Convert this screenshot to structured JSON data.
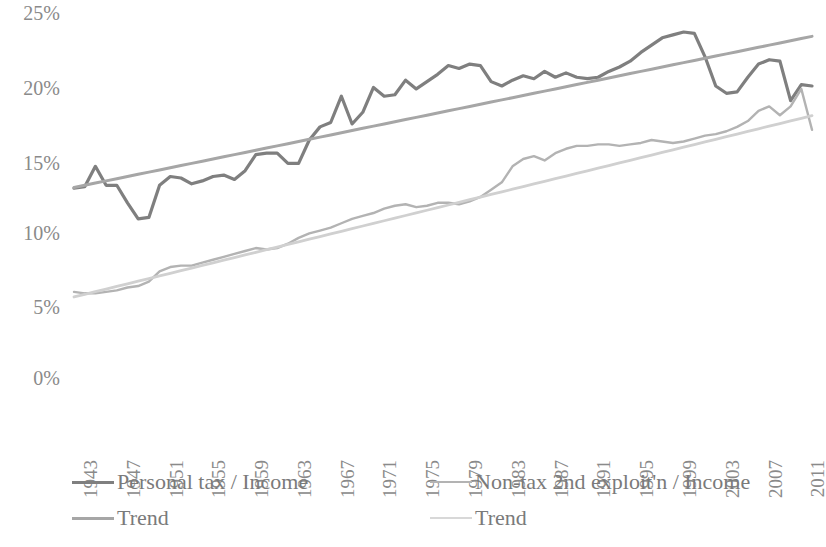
{
  "chart_data": {
    "type": "line",
    "title": "",
    "xlabel": "",
    "ylabel": "",
    "ylim": [
      0,
      25
    ],
    "y_ticks": [
      0,
      5,
      10,
      15,
      20,
      25
    ],
    "y_tick_labels": [
      "0%",
      "5%",
      "10%",
      "15%",
      "20%",
      "25%"
    ],
    "grid": false,
    "legend_position": "bottom",
    "x_start": 1943,
    "x_end": 2012,
    "x_tick_labels": [
      "1943",
      "1947",
      "1951",
      "1955",
      "1959",
      "1963",
      "1967",
      "1971",
      "1975",
      "1979",
      "1983",
      "1987",
      "1991",
      "1995",
      "1999",
      "2003",
      "2007",
      "2011"
    ],
    "x": [
      1943,
      1944,
      1945,
      1946,
      1947,
      1948,
      1949,
      1950,
      1951,
      1952,
      1953,
      1954,
      1955,
      1956,
      1957,
      1958,
      1959,
      1960,
      1961,
      1962,
      1963,
      1964,
      1965,
      1966,
      1967,
      1968,
      1969,
      1970,
      1971,
      1972,
      1973,
      1974,
      1975,
      1976,
      1977,
      1978,
      1979,
      1980,
      1981,
      1982,
      1983,
      1984,
      1985,
      1986,
      1987,
      1988,
      1989,
      1990,
      1991,
      1992,
      1993,
      1994,
      1995,
      1996,
      1997,
      1998,
      1999,
      2000,
      2001,
      2002,
      2003,
      2004,
      2005,
      2006,
      2007,
      2008,
      2009,
      2010,
      2011,
      2012
    ],
    "series": [
      {
        "name": "Personal tax / Income",
        "color": "#7f7f7f",
        "width": 3.2,
        "values": [
          13.0,
          13.1,
          14.5,
          13.2,
          13.2,
          12.0,
          10.9,
          11.0,
          13.2,
          13.8,
          13.7,
          13.3,
          13.5,
          13.8,
          13.9,
          13.6,
          14.2,
          15.3,
          15.4,
          15.4,
          14.7,
          14.7,
          16.3,
          17.2,
          17.5,
          19.3,
          17.4,
          18.2,
          19.9,
          19.3,
          19.4,
          20.4,
          19.8,
          20.3,
          20.8,
          21.4,
          21.2,
          21.5,
          21.4,
          20.3,
          20.0,
          20.4,
          20.7,
          20.5,
          21.0,
          20.6,
          20.9,
          20.6,
          20.5,
          20.6,
          21.0,
          21.3,
          21.7,
          22.3,
          22.8,
          23.3,
          23.5,
          23.7,
          23.6,
          22.0,
          20.0,
          19.5,
          19.6,
          20.6,
          21.5,
          21.8,
          21.7,
          19.0,
          20.1,
          20.0
        ]
      },
      {
        "name": "Trend",
        "color": "#a6a6a6",
        "width": 3.0,
        "trend_for": "Personal tax / Income",
        "values": [
          13.05,
          13.2,
          13.35,
          13.5,
          13.65,
          13.8,
          13.95,
          14.1,
          14.25,
          14.4,
          14.55,
          14.7,
          14.85,
          15.0,
          15.15,
          15.3,
          15.45,
          15.6,
          15.75,
          15.9,
          16.05,
          16.2,
          16.35,
          16.5,
          16.65,
          16.8,
          16.95,
          17.1,
          17.25,
          17.4,
          17.55,
          17.7,
          17.85,
          18.0,
          18.15,
          18.3,
          18.45,
          18.6,
          18.75,
          18.9,
          19.05,
          19.2,
          19.35,
          19.5,
          19.65,
          19.8,
          19.95,
          20.1,
          20.25,
          20.4,
          20.55,
          20.7,
          20.85,
          21.0,
          21.15,
          21.3,
          21.45,
          21.6,
          21.75,
          21.9,
          22.05,
          22.2,
          22.35,
          22.5,
          22.65,
          22.8,
          22.95,
          23.1,
          23.25,
          23.4
        ]
      },
      {
        "name": "Non-tax 2nd exploit'n / Income",
        "color": "#b3b3b3",
        "width": 2.4,
        "values": [
          5.9,
          5.8,
          5.8,
          5.9,
          6.0,
          6.2,
          6.3,
          6.6,
          7.3,
          7.6,
          7.7,
          7.7,
          7.9,
          8.1,
          8.3,
          8.5,
          8.7,
          8.9,
          8.8,
          8.9,
          9.2,
          9.6,
          9.9,
          10.1,
          10.3,
          10.6,
          10.9,
          11.1,
          11.3,
          11.6,
          11.8,
          11.9,
          11.7,
          11.8,
          12.0,
          12.0,
          11.9,
          12.1,
          12.4,
          12.9,
          13.4,
          14.5,
          15.0,
          15.2,
          14.9,
          15.4,
          15.7,
          15.9,
          15.9,
          16.0,
          16.0,
          15.9,
          16.0,
          16.1,
          16.3,
          16.2,
          16.1,
          16.2,
          16.4,
          16.6,
          16.7,
          16.9,
          17.2,
          17.6,
          18.3,
          18.6,
          18.0,
          18.6,
          19.8,
          17.0
        ]
      },
      {
        "name": "Trend",
        "color": "#d0d0d0",
        "width": 2.8,
        "trend_for": "Non-tax 2nd exploit'n / Income",
        "values": [
          5.55,
          5.73,
          5.91,
          6.09,
          6.27,
          6.45,
          6.63,
          6.81,
          6.99,
          7.17,
          7.35,
          7.53,
          7.71,
          7.89,
          8.07,
          8.25,
          8.43,
          8.61,
          8.79,
          8.97,
          9.15,
          9.33,
          9.51,
          9.69,
          9.87,
          10.05,
          10.23,
          10.41,
          10.59,
          10.77,
          10.95,
          11.13,
          11.31,
          11.49,
          11.67,
          11.85,
          12.03,
          12.21,
          12.39,
          12.57,
          12.75,
          12.93,
          13.11,
          13.29,
          13.47,
          13.65,
          13.83,
          14.01,
          14.19,
          14.37,
          14.55,
          14.73,
          14.91,
          15.09,
          15.27,
          15.45,
          15.63,
          15.81,
          15.99,
          16.17,
          16.35,
          16.53,
          16.71,
          16.89,
          17.07,
          17.25,
          17.43,
          17.61,
          17.79,
          17.97
        ]
      }
    ]
  },
  "legend": {
    "items": [
      {
        "label": "Personal tax / Income",
        "color": "#7f7f7f",
        "thickness": "3px"
      },
      {
        "label": "Trend",
        "color": "#a6a6a6",
        "thickness": "3px"
      },
      {
        "label": "Non-tax 2nd exploit'n / Income",
        "color": "#b3b3b3",
        "thickness": "2px"
      },
      {
        "label": "Trend",
        "color": "#d8d8d8",
        "thickness": "2px"
      }
    ]
  }
}
